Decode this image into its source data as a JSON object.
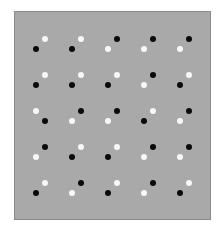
{
  "figure": {
    "panel": {
      "background": "#a9a9a9",
      "border": "#8a8a8a",
      "left": 14,
      "top": 11,
      "width": 197,
      "height": 209
    },
    "colors": {
      "black": "#0a0a0a",
      "white": "#f8f8f8"
    },
    "grid": {
      "rows": 5,
      "cols": 5,
      "col_left_x": [
        36,
        72,
        108,
        144,
        180
      ],
      "row_upper_y": [
        39,
        75,
        111,
        147,
        183
      ],
      "pair_dx": 9,
      "pair_dy": 10,
      "dot_diameter": 6
    },
    "pairs": [
      [
        {
          "upper": "white",
          "orientation": "rising"
        },
        {
          "upper": "white",
          "orientation": "rising"
        },
        {
          "upper": "black",
          "orientation": "rising"
        },
        {
          "upper": "black",
          "orientation": "rising"
        },
        {
          "upper": "black",
          "orientation": "rising"
        }
      ],
      [
        {
          "upper": "white",
          "orientation": "rising"
        },
        {
          "upper": "white",
          "orientation": "rising"
        },
        {
          "upper": "white",
          "orientation": "rising"
        },
        {
          "upper": "black",
          "orientation": "rising"
        },
        {
          "upper": "white",
          "orientation": "rising"
        }
      ],
      [
        {
          "upper": "white",
          "orientation": "falling"
        },
        {
          "upper": "black",
          "orientation": "rising"
        },
        {
          "upper": "black",
          "orientation": "rising"
        },
        {
          "upper": "white",
          "orientation": "rising"
        },
        {
          "upper": "black",
          "orientation": "rising"
        }
      ],
      [
        {
          "upper": "black",
          "orientation": "rising"
        },
        {
          "upper": "white",
          "orientation": "rising"
        },
        {
          "upper": "white",
          "orientation": "rising"
        },
        {
          "upper": "black",
          "orientation": "rising"
        },
        {
          "upper": "black",
          "orientation": "rising"
        }
      ],
      [
        {
          "upper": "white",
          "orientation": "rising"
        },
        {
          "upper": "black",
          "orientation": "rising"
        },
        {
          "upper": "white",
          "orientation": "rising"
        },
        {
          "upper": "black",
          "orientation": "rising"
        },
        {
          "upper": "white",
          "orientation": "rising"
        }
      ]
    ]
  }
}
